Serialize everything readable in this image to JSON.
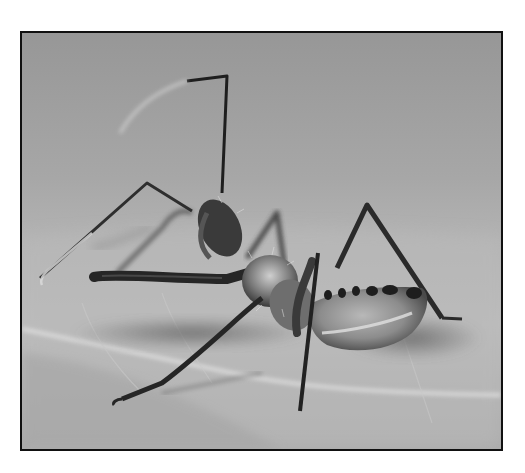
{
  "photo": {
    "subject": "wheel bug nymph on leaf",
    "style": "grayscale macro photograph",
    "frame_color": "#111111",
    "page_background": "#ffffff",
    "tones": {
      "background_top": "#9a9a9a",
      "background_mid": "#b0b0b0",
      "leaf_surface": "#bdbdbd",
      "leaf_lower": "#a9a9a9",
      "leaf_vein": "#dcdcdc",
      "shadow": "#6e6e6e",
      "insect_dark": "#2a2a2a",
      "insect_mid": "#707070",
      "insect_light": "#d0d0d0"
    }
  }
}
